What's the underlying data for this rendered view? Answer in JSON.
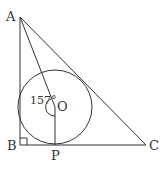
{
  "diagram": {
    "points": {
      "A": {
        "label": "A"
      },
      "B": {
        "label": "B"
      },
      "C": {
        "label": "C"
      },
      "O": {
        "label": "O"
      },
      "P": {
        "label": "P"
      }
    },
    "angle_label": "157°",
    "stroke_color": "#333333"
  }
}
